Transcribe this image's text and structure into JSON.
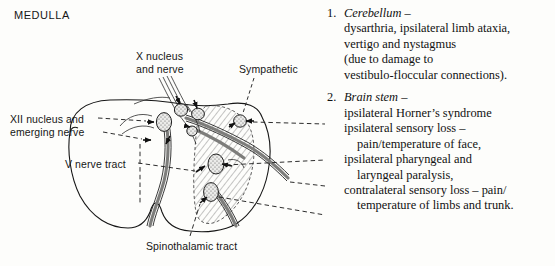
{
  "title": "MEDULLA",
  "diagram_labels": {
    "x_nucleus": "X nucleus\nand nerve",
    "sympathetic": "Sympathetic",
    "xii_nucleus": "XII nucleus and\nemerging nerve",
    "v_nerve_tract": "V nerve tract",
    "spinothalamic": "Spinothalamic tract"
  },
  "clinical_list": [
    {
      "number": "1.",
      "heading": "Cerebellum",
      "dash": " –",
      "lines": [
        {
          "text": "dysarthria, ipsilateral limb ataxia,",
          "indent": false
        },
        {
          "text": "vertigo and nystagmus",
          "indent": false
        },
        {
          "text": "(due to damage to",
          "indent": false
        },
        {
          "text": "vestibulo-floccular connections).",
          "indent": false
        }
      ]
    },
    {
      "number": "2.",
      "heading": "Brain stem",
      "dash": " –",
      "lines": [
        {
          "text": "ipsilateral Horner’s syndrome",
          "indent": false
        },
        {
          "text": "ipsilateral sensory loss –",
          "indent": false
        },
        {
          "text": "pain/temperature of face,",
          "indent": true
        },
        {
          "text": "ipsilateral pharyngeal and",
          "indent": false
        },
        {
          "text": "laryngeal paralysis,",
          "indent": true
        },
        {
          "text": "contralateral sensory loss – pain/",
          "indent": false
        },
        {
          "text": "temperature of limbs and trunk.",
          "indent": true
        }
      ]
    }
  ],
  "colors": {
    "ink": "#161616",
    "background": "#fdfdfb",
    "nucleus_fill": "#e3e3e1",
    "tract_fill": "#b9b9b7",
    "hatch": "#5a5a5a"
  }
}
